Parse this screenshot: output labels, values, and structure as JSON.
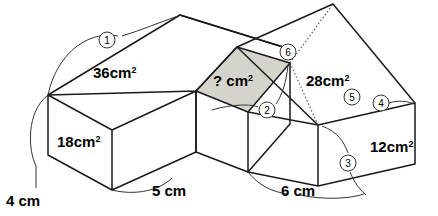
{
  "figure": {
    "shaded_face_color": "#d6d3cd",
    "line_color": "#1a1a1a",
    "background": "#ffffff"
  },
  "area_labels": [
    {
      "id": "left-top-area",
      "value": "36",
      "unit": "cm",
      "exponent": "2",
      "text": "36cm²"
    },
    {
      "id": "left-front-area",
      "value": "18",
      "unit": "cm",
      "exponent": "2",
      "text": "18cm²"
    },
    {
      "id": "center-top-area",
      "value": "?",
      "unit": "cm",
      "exponent": "2",
      "text": "? cm²"
    },
    {
      "id": "right-top-area",
      "value": "28",
      "unit": "cm",
      "exponent": "2",
      "text": "28cm²"
    },
    {
      "id": "right-end-area",
      "value": "12",
      "unit": "cm",
      "exponent": "2",
      "text": "12cm²"
    }
  ],
  "dimension_labels": [
    {
      "id": "height-dim",
      "text": "4 cm"
    },
    {
      "id": "left-depth-dim",
      "text": "5 cm"
    },
    {
      "id": "right-depth-dim",
      "text": "6 cm"
    }
  ],
  "callouts": [
    {
      "id": "callout-1",
      "label": "1"
    },
    {
      "id": "callout-2",
      "label": "2"
    },
    {
      "id": "callout-3",
      "label": "3"
    },
    {
      "id": "callout-4",
      "label": "4"
    },
    {
      "id": "callout-5",
      "label": "5"
    },
    {
      "id": "callout-6",
      "label": "6"
    }
  ]
}
